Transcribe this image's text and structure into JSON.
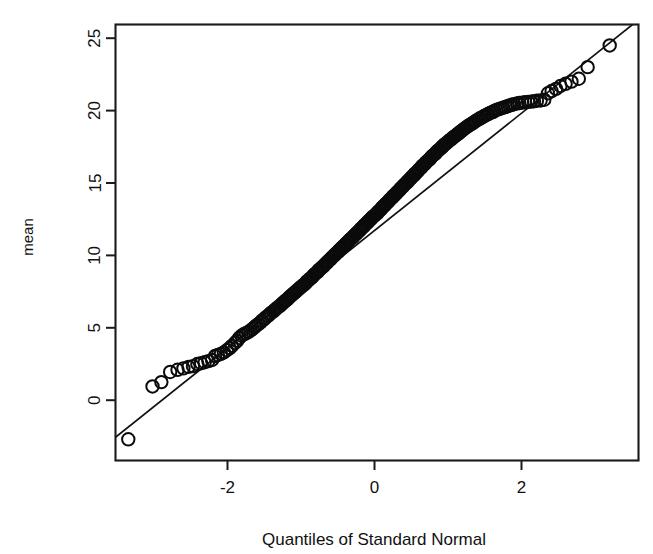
{
  "figure": {
    "title": "",
    "background_color": "#ffffff",
    "foreground_color": "#111111",
    "width": 653,
    "height": 554
  },
  "axis_titles": {
    "x": "Quantiles of Standard Normal",
    "y": "mean"
  },
  "ticks": {
    "x_labels": [
      "-2",
      "0",
      "2"
    ],
    "y_labels": [
      "0",
      "5",
      "10",
      "15",
      "20",
      "25"
    ]
  },
  "chart_data": {
    "type": "scatter",
    "subtype": "qq-plot",
    "title": "",
    "xlabel": "Quantiles of Standard Normal",
    "ylabel": "mean",
    "xlim": [
      -3.62,
      3.55
    ],
    "ylim": [
      -3.6,
      25.9
    ],
    "xticks": [
      -2,
      0,
      2
    ],
    "yticks": [
      0,
      5,
      10,
      15,
      20,
      25
    ],
    "grid": false,
    "legend": null,
    "marker": "open-circle",
    "marker_color": "#0b0b0b",
    "marker_fill": "none",
    "reference_line": {
      "name": "qq-line",
      "description": "straight robust quantile reference line drawn across the full panel",
      "x": [
        -3.62,
        3.55
      ],
      "y": [
        -2.95,
        26.1
      ],
      "slope": 4.05,
      "intercept": 11.71,
      "color": "#111111"
    },
    "n_points": 520,
    "points": [
      [
        -3.35,
        -2.7
      ],
      [
        -3.02,
        0.95
      ],
      [
        -2.9,
        1.25
      ],
      [
        -2.78,
        1.95
      ],
      [
        -2.68,
        2.1
      ],
      [
        -2.6,
        2.2
      ],
      [
        -2.53,
        2.3
      ],
      [
        -2.47,
        2.35
      ],
      [
        -2.41,
        2.5
      ],
      [
        -2.36,
        2.55
      ],
      [
        -2.31,
        2.62
      ],
      [
        -2.26,
        2.7
      ],
      [
        -2.21,
        2.78
      ],
      [
        -2.17,
        3.05
      ],
      [
        -2.13,
        3.12
      ],
      [
        -2.09,
        3.2
      ],
      [
        -2.05,
        3.3
      ],
      [
        -2.01,
        3.45
      ],
      [
        -1.97,
        3.6
      ],
      [
        -1.94,
        3.75
      ],
      [
        -1.9,
        3.95
      ],
      [
        -1.87,
        4.1
      ],
      [
        -1.84,
        4.3
      ],
      [
        -1.81,
        4.45
      ],
      [
        -1.78,
        4.55
      ],
      [
        -1.75,
        4.62
      ],
      [
        -1.72,
        4.7
      ],
      [
        -1.69,
        4.8
      ],
      [
        -1.66,
        4.92
      ],
      [
        -1.63,
        5.05
      ],
      [
        -1.61,
        5.15
      ],
      [
        -1.58,
        5.25
      ],
      [
        -1.55,
        5.38
      ],
      [
        -1.53,
        5.5
      ],
      [
        -1.5,
        5.6
      ],
      [
        -1.48,
        5.72
      ],
      [
        -1.45,
        5.82
      ],
      [
        -1.43,
        5.92
      ],
      [
        -1.41,
        6.02
      ],
      [
        -1.38,
        6.12
      ],
      [
        -1.36,
        6.22
      ],
      [
        -1.34,
        6.3
      ],
      [
        -1.32,
        6.4
      ],
      [
        -1.29,
        6.5
      ],
      [
        -1.27,
        6.6
      ],
      [
        -1.25,
        6.7
      ],
      [
        -1.23,
        6.78
      ],
      [
        -1.21,
        6.88
      ],
      [
        -1.19,
        6.95
      ],
      [
        -1.17,
        7.05
      ],
      [
        -1.15,
        7.15
      ],
      [
        -1.13,
        7.25
      ],
      [
        -1.11,
        7.32
      ],
      [
        -1.09,
        7.42
      ],
      [
        -1.07,
        7.5
      ],
      [
        -1.05,
        7.6
      ],
      [
        -1.03,
        7.68
      ],
      [
        -1.01,
        7.78
      ],
      [
        -0.99,
        7.85
      ],
      [
        -0.97,
        7.95
      ],
      [
        -0.95,
        8.02
      ],
      [
        -0.93,
        8.12
      ],
      [
        -0.92,
        8.2
      ],
      [
        -0.9,
        8.28
      ],
      [
        -0.88,
        8.38
      ],
      [
        -0.86,
        8.45
      ],
      [
        -0.84,
        8.55
      ],
      [
        -0.83,
        8.62
      ],
      [
        -0.81,
        8.72
      ],
      [
        -0.79,
        8.8
      ],
      [
        -0.77,
        8.88
      ],
      [
        -0.76,
        8.98
      ],
      [
        -0.74,
        9.05
      ],
      [
        -0.72,
        9.15
      ],
      [
        -0.7,
        9.22
      ],
      [
        -0.69,
        9.3
      ],
      [
        -0.67,
        9.4
      ],
      [
        -0.65,
        9.48
      ],
      [
        -0.64,
        9.55
      ],
      [
        -0.62,
        9.65
      ],
      [
        -0.6,
        9.72
      ],
      [
        -0.59,
        9.8
      ],
      [
        -0.57,
        9.9
      ],
      [
        -0.55,
        9.98
      ],
      [
        -0.54,
        10.05
      ],
      [
        -0.52,
        10.15
      ],
      [
        -0.5,
        10.22
      ],
      [
        -0.49,
        10.3
      ],
      [
        -0.47,
        10.4
      ],
      [
        -0.45,
        10.48
      ],
      [
        -0.44,
        10.55
      ],
      [
        -0.42,
        10.65
      ],
      [
        -0.4,
        10.72
      ],
      [
        -0.39,
        10.8
      ],
      [
        -0.37,
        10.9
      ],
      [
        -0.35,
        10.98
      ],
      [
        -0.34,
        11.05
      ],
      [
        -0.32,
        11.15
      ],
      [
        -0.3,
        11.22
      ],
      [
        -0.29,
        11.3
      ],
      [
        -0.27,
        11.4
      ],
      [
        -0.25,
        11.48
      ],
      [
        -0.24,
        11.55
      ],
      [
        -0.22,
        11.65
      ],
      [
        -0.2,
        11.72
      ],
      [
        -0.19,
        11.82
      ],
      [
        -0.17,
        11.9
      ],
      [
        -0.15,
        11.98
      ],
      [
        -0.14,
        12.08
      ],
      [
        -0.12,
        12.15
      ],
      [
        -0.1,
        12.25
      ],
      [
        -0.09,
        12.32
      ],
      [
        -0.07,
        12.42
      ],
      [
        -0.05,
        12.5
      ],
      [
        -0.04,
        12.58
      ],
      [
        -0.02,
        12.68
      ],
      [
        0.0,
        12.75
      ],
      [
        0.02,
        12.85
      ],
      [
        0.04,
        12.92
      ],
      [
        0.05,
        13.02
      ],
      [
        0.07,
        13.1
      ],
      [
        0.09,
        13.2
      ],
      [
        0.1,
        13.28
      ],
      [
        0.12,
        13.38
      ],
      [
        0.14,
        13.45
      ],
      [
        0.15,
        13.55
      ],
      [
        0.17,
        13.62
      ],
      [
        0.19,
        13.72
      ],
      [
        0.2,
        13.8
      ],
      [
        0.22,
        13.9
      ],
      [
        0.24,
        13.98
      ],
      [
        0.25,
        14.08
      ],
      [
        0.27,
        14.15
      ],
      [
        0.29,
        14.25
      ],
      [
        0.3,
        14.32
      ],
      [
        0.32,
        14.42
      ],
      [
        0.34,
        14.5
      ],
      [
        0.35,
        14.6
      ],
      [
        0.37,
        14.68
      ],
      [
        0.39,
        14.78
      ],
      [
        0.4,
        14.85
      ],
      [
        0.42,
        14.95
      ],
      [
        0.44,
        15.02
      ],
      [
        0.45,
        15.12
      ],
      [
        0.47,
        15.2
      ],
      [
        0.49,
        15.3
      ],
      [
        0.5,
        15.38
      ],
      [
        0.52,
        15.48
      ],
      [
        0.54,
        15.55
      ],
      [
        0.55,
        15.65
      ],
      [
        0.57,
        15.72
      ],
      [
        0.59,
        15.82
      ],
      [
        0.6,
        15.9
      ],
      [
        0.62,
        16.0
      ],
      [
        0.64,
        16.08
      ],
      [
        0.65,
        16.18
      ],
      [
        0.67,
        16.25
      ],
      [
        0.69,
        16.35
      ],
      [
        0.7,
        16.42
      ],
      [
        0.72,
        16.52
      ],
      [
        0.74,
        16.6
      ],
      [
        0.76,
        16.7
      ],
      [
        0.77,
        16.78
      ],
      [
        0.79,
        16.88
      ],
      [
        0.81,
        16.95
      ],
      [
        0.83,
        17.05
      ],
      [
        0.84,
        17.12
      ],
      [
        0.86,
        17.22
      ],
      [
        0.88,
        17.3
      ],
      [
        0.9,
        17.4
      ],
      [
        0.92,
        17.48
      ],
      [
        0.93,
        17.55
      ],
      [
        0.95,
        17.65
      ],
      [
        0.97,
        17.72
      ],
      [
        0.99,
        17.8
      ],
      [
        1.01,
        17.9
      ],
      [
        1.03,
        17.98
      ],
      [
        1.05,
        18.05
      ],
      [
        1.07,
        18.15
      ],
      [
        1.09,
        18.22
      ],
      [
        1.11,
        18.3
      ],
      [
        1.13,
        18.38
      ],
      [
        1.15,
        18.45
      ],
      [
        1.17,
        18.55
      ],
      [
        1.19,
        18.62
      ],
      [
        1.21,
        18.7
      ],
      [
        1.23,
        18.78
      ],
      [
        1.25,
        18.85
      ],
      [
        1.27,
        18.92
      ],
      [
        1.29,
        19.0
      ],
      [
        1.32,
        19.08
      ],
      [
        1.34,
        19.15
      ],
      [
        1.36,
        19.22
      ],
      [
        1.38,
        19.3
      ],
      [
        1.41,
        19.38
      ],
      [
        1.43,
        19.45
      ],
      [
        1.45,
        19.5
      ],
      [
        1.48,
        19.58
      ],
      [
        1.5,
        19.65
      ],
      [
        1.53,
        19.72
      ],
      [
        1.55,
        19.78
      ],
      [
        1.58,
        19.85
      ],
      [
        1.61,
        19.9
      ],
      [
        1.63,
        19.98
      ],
      [
        1.66,
        20.05
      ],
      [
        1.69,
        20.1
      ],
      [
        1.72,
        20.15
      ],
      [
        1.75,
        20.2
      ],
      [
        1.78,
        20.25
      ],
      [
        1.81,
        20.3
      ],
      [
        1.84,
        20.35
      ],
      [
        1.87,
        20.4
      ],
      [
        1.9,
        20.45
      ],
      [
        1.94,
        20.5
      ],
      [
        1.97,
        20.52
      ],
      [
        2.01,
        20.55
      ],
      [
        2.05,
        20.58
      ],
      [
        2.09,
        20.6
      ],
      [
        2.13,
        20.62
      ],
      [
        2.17,
        20.65
      ],
      [
        2.21,
        20.68
      ],
      [
        2.26,
        20.7
      ],
      [
        2.31,
        20.75
      ],
      [
        2.36,
        21.2
      ],
      [
        2.41,
        21.35
      ],
      [
        2.47,
        21.5
      ],
      [
        2.53,
        21.7
      ],
      [
        2.6,
        21.85
      ],
      [
        2.68,
        22.0
      ],
      [
        2.78,
        22.2
      ],
      [
        2.9,
        23.0
      ],
      [
        3.2,
        24.5
      ]
    ]
  }
}
